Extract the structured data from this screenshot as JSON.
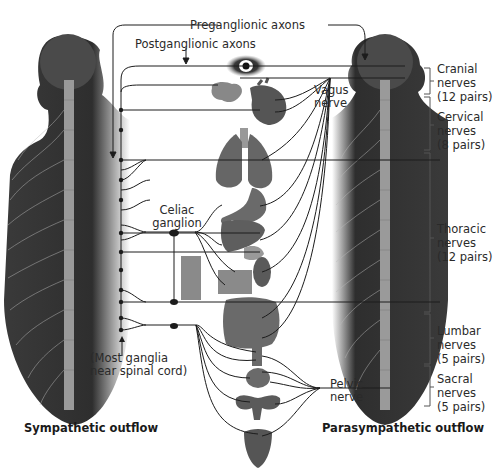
{
  "diagram": {
    "title_left": "Sympathetic outflow",
    "title_right": "Parasympathetic outflow",
    "labels": {
      "preganglionic": "Preganglionic axons",
      "postganglionic": "Postganglionic axons",
      "vagus_line1": "Vagus",
      "vagus_line2": "nerve",
      "celiac_line1": "Celiac",
      "celiac_line2": "ganglion",
      "ganglia_line1": "(Most ganglia",
      "ganglia_line2": "near spinal cord)",
      "pelvic_line1": "Pelvic",
      "pelvic_line2": "nerve"
    },
    "spinal_regions": [
      {
        "name": "Cranial",
        "line2": "nerves",
        "line3": "(12 pairs)"
      },
      {
        "name": "Cervical",
        "line2": "nerves",
        "line3": "(8 pairs)"
      },
      {
        "name": "Thoracic",
        "line2": "nerves",
        "line3": "(12 pairs)"
      },
      {
        "name": "Lumbar",
        "line2": "nerves",
        "line3": "(5 pairs)"
      },
      {
        "name": "Sacral",
        "line2": "nerves",
        "line3": "(5 pairs)"
      }
    ],
    "organs": [
      "eye",
      "salivary-glands",
      "heart",
      "lungs",
      "stomach",
      "liver",
      "pancreas",
      "adrenal-kidney",
      "intestines",
      "rectum",
      "bladder",
      "reproductive-organs",
      "genitalia"
    ],
    "colors": {
      "body_dark": "#2e2e2e",
      "body_mid": "#555555",
      "spine": "#9a9a9a",
      "organ": "#6e6e6e",
      "nerve_line": "#1c1c1c",
      "text": "#2a2a2a"
    }
  }
}
